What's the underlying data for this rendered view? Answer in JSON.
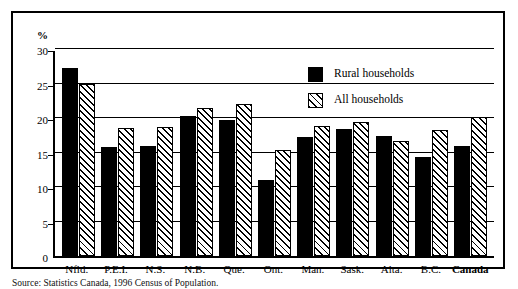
{
  "chart_data": {
    "type": "bar",
    "title": "",
    "subtitle": "",
    "xlabel": "",
    "ylabel": "%",
    "ylim": [
      0,
      30
    ],
    "yticks": [
      0,
      5,
      10,
      15,
      20,
      25,
      30
    ],
    "ytick_labels": [
      "0",
      "5",
      "10",
      "15",
      "20",
      "25",
      "30"
    ],
    "grid": true,
    "grid_axis": "y",
    "legend_position": "upper-right-inside",
    "categories": [
      "Nfld.",
      "P.E.I.",
      "N.S.",
      "N.B.",
      "Que.",
      "Ont.",
      "Man.",
      "Sask.",
      "Alta.",
      "B.C.",
      "Canada"
    ],
    "emphasized_categories": [
      "Canada"
    ],
    "series": [
      {
        "name": "Rural households",
        "style": "solid-black",
        "color": "#000000",
        "values": [
          27.3,
          15.8,
          16.0,
          20.3,
          19.7,
          11.0,
          17.3,
          18.4,
          17.4,
          14.3,
          16.0
        ]
      },
      {
        "name": "All households",
        "style": "diagonal-hatch",
        "color": "#ffffff",
        "values": [
          24.9,
          18.5,
          18.7,
          21.5,
          22.1,
          15.3,
          18.8,
          19.4,
          16.6,
          18.2,
          20.1
        ]
      }
    ],
    "annotations": []
  },
  "axis": {
    "unit_label": "%"
  },
  "legend": {
    "items": [
      {
        "label": "Rural households",
        "swatch": "solid-black-swatch"
      },
      {
        "label": "All households",
        "swatch": "hatched-swatch"
      }
    ]
  },
  "source_note": {
    "label": "Source:",
    "text": "Statistics Canada, 1996 Census of Population."
  }
}
